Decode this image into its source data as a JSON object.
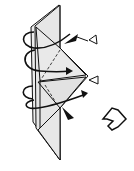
{
  "diagram": {
    "title": "Origami folding step",
    "type": "origami-instruction",
    "colors": {
      "line": "#111111",
      "paper": "#ebebeb",
      "paper_shade": "#dcdcdc",
      "background": "#ffffff"
    },
    "elements": {
      "model": "folded-paper-model",
      "rotate_arrows": 2,
      "push_arrows": 2,
      "hollow_triangle_markers": 2,
      "next_step_arrow": "hollow-right-arrow"
    }
  }
}
